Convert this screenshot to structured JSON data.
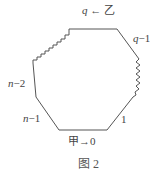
{
  "diagram": {
    "type": "polygon-seating",
    "stroke_color": "#555555",
    "labels": {
      "top": {
        "var": "q",
        "arrow": "←",
        "name": "乙"
      },
      "top_right": {
        "var": "q",
        "suffix": "−1"
      },
      "left_upper": {
        "var": "n",
        "suffix": "−2"
      },
      "left_lower": {
        "var": "n",
        "suffix": "−1"
      },
      "bottom_right": {
        "text": "1"
      },
      "bottom": {
        "name": "甲",
        "arrow": "→",
        "value": "0"
      }
    },
    "caption": "图 2"
  }
}
